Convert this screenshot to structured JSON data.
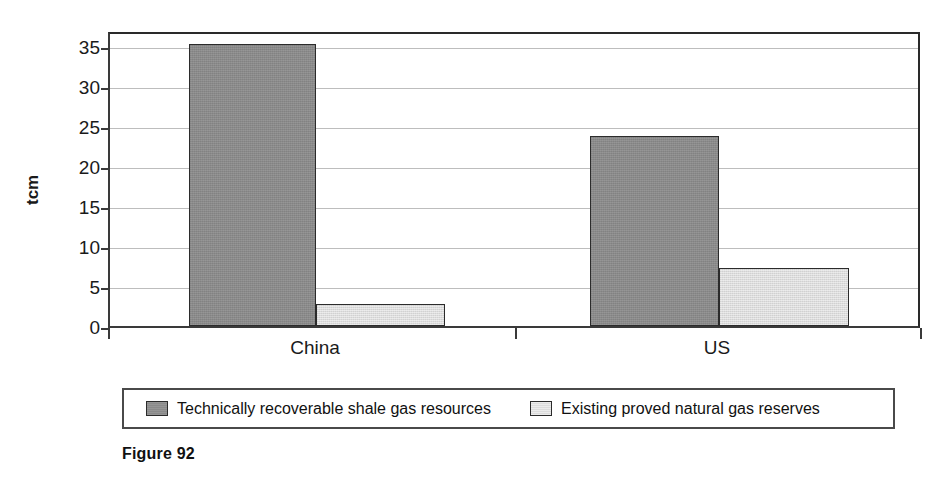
{
  "chart_data": {
    "type": "bar",
    "title": "",
    "xlabel": "",
    "ylabel": "tcm",
    "categories": [
      "China",
      "US"
    ],
    "series": [
      {
        "name": "Technically recoverable shale gas resources",
        "color": "#8a8a8a",
        "values": [
          35.2,
          23.7
        ]
      },
      {
        "name": "Existing proved natural gas reserves",
        "color": "#dcdcdc",
        "values": [
          2.8,
          7.2
        ]
      }
    ],
    "ylim": [
      0,
      37
    ],
    "yticks": [
      0,
      5,
      10,
      15,
      20,
      25,
      30,
      35
    ],
    "ytick_labels": [
      "0",
      "5",
      "10",
      "15",
      "20",
      "25",
      "30",
      "35"
    ],
    "grid": true,
    "legend_position": "bottom"
  },
  "axes": {
    "y_title": "tcm",
    "y_ticks": [
      {
        "value": 35,
        "label": "35"
      },
      {
        "value": 30,
        "label": "30"
      },
      {
        "value": 25,
        "label": "25"
      },
      {
        "value": 20,
        "label": "20"
      },
      {
        "value": 15,
        "label": "15"
      },
      {
        "value": 10,
        "label": "10"
      },
      {
        "value": 5,
        "label": "5"
      },
      {
        "value": 0,
        "label": "0"
      }
    ],
    "x_categories": [
      {
        "label": "China"
      },
      {
        "label": "US"
      }
    ]
  },
  "legend": {
    "entries": [
      {
        "label": "Technically recoverable shale gas resources",
        "swatch": "dark-gray-swatch"
      },
      {
        "label": "Existing proved natural gas reserves",
        "swatch": "light-gray-swatch"
      }
    ]
  },
  "caption": {
    "text": "Figure 92"
  },
  "colors": {
    "series_dark": "#8a8a8a",
    "series_light": "#dcdcdc",
    "axis": "#2b2b2b",
    "grid": "#bdbdbd"
  }
}
